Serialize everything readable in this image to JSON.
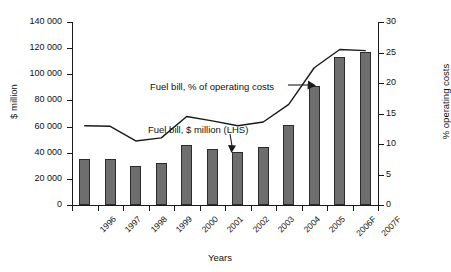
{
  "chart_data": {
    "type": "bar",
    "title": "",
    "xlabel": "Years",
    "ylabel": "$ million",
    "y2label": "% operating costs",
    "categories": [
      "1996",
      "1997",
      "1998",
      "1999",
      "2000",
      "2001",
      "2002",
      "2003",
      "2004",
      "2005",
      "2006F",
      "2007F"
    ],
    "ylim": [
      0,
      140000
    ],
    "y2lim": [
      0,
      30
    ],
    "yticks": [
      "0",
      "20 000",
      "40 000",
      "60 000",
      "80 000",
      "100 000",
      "120 000",
      "140 000"
    ],
    "ytick_values": [
      0,
      20000,
      40000,
      60000,
      80000,
      100000,
      120000,
      140000
    ],
    "y2ticks": [
      "0",
      "5",
      "10",
      "15",
      "20",
      "25",
      "30"
    ],
    "y2tick_values": [
      0,
      5,
      10,
      15,
      20,
      25,
      30
    ],
    "grid": false,
    "legend": "none",
    "series": [
      {
        "name": "Fuel bill, $ million (LHS)",
        "type": "bar",
        "axis": "left",
        "color": "#6e6e6e",
        "values": [
          35000,
          35000,
          29500,
          32500,
          46000,
          43000,
          40500,
          44000,
          61000,
          91000,
          113000,
          117000
        ]
      },
      {
        "name": "Fuel bill, % of operating costs",
        "type": "line",
        "axis": "right",
        "color": "#1a1a1a",
        "values": [
          13.0,
          12.9,
          10.5,
          11.0,
          14.5,
          13.8,
          13.0,
          13.6,
          16.5,
          22.5,
          25.5,
          25.3
        ]
      }
    ],
    "annotations": [
      {
        "text": "Fuel  bill, % of operating costs",
        "points_to": "line-series",
        "arrow": "right"
      },
      {
        "text": "Fuel bill, $ million (LHS)",
        "points_to": "bar-series",
        "arrow": "down"
      }
    ]
  }
}
